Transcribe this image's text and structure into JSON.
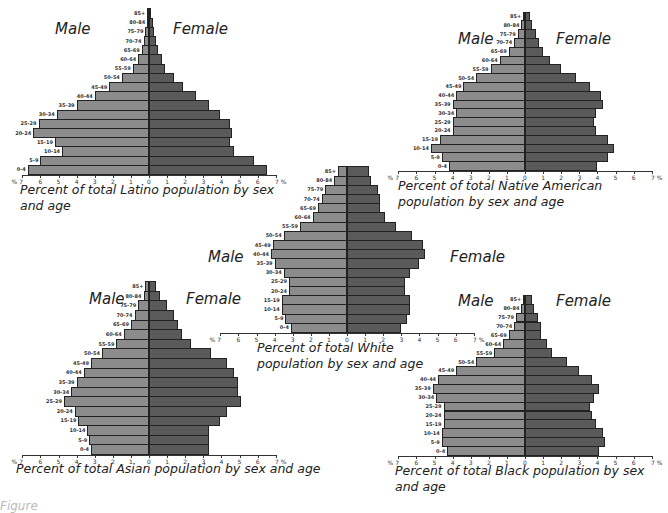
{
  "age_groups": [
    "0-4",
    "5-9",
    "10-14",
    "15-19",
    "20-24",
    "25-29",
    "30-34",
    "35-39",
    "40-44",
    "45-49",
    "50-54",
    "55-59",
    "60-64",
    "65-69",
    "70-74",
    "75-79",
    "80-84",
    "85+"
  ],
  "labels": {
    "male": "Male",
    "female": "Female",
    "axis_unit": "%"
  },
  "colors": {
    "male": "#8c8c8c",
    "female": "#5a5a5a",
    "outline": "#222222"
  },
  "chart_data": [
    {
      "type": "bar",
      "subtype": "population-pyramid",
      "title": "Percent of total Latino population by sex and age",
      "categories": [
        "0-4",
        "5-9",
        "10-14",
        "15-19",
        "20-24",
        "25-29",
        "30-34",
        "35-39",
        "40-44",
        "45-49",
        "50-54",
        "55-59",
        "60-64",
        "65-69",
        "70-74",
        "75-79",
        "80-84",
        "85+"
      ],
      "series": [
        {
          "name": "Male",
          "values": [
            6.7,
            6.0,
            4.8,
            5.2,
            6.4,
            6.1,
            5.1,
            4.0,
            3.0,
            2.2,
            1.5,
            0.9,
            0.6,
            0.4,
            0.3,
            0.2,
            0.1,
            0.1
          ]
        },
        {
          "name": "Female",
          "values": [
            6.5,
            5.8,
            4.7,
            4.5,
            4.6,
            4.5,
            3.9,
            3.3,
            2.6,
            1.9,
            1.4,
            0.9,
            0.7,
            0.5,
            0.4,
            0.3,
            0.2,
            0.1
          ]
        }
      ],
      "xlabel": "%",
      "xticks": [
        7,
        6,
        5,
        4,
        3,
        2,
        1,
        0,
        1,
        2,
        3,
        4,
        5,
        6,
        7
      ],
      "xlim": [
        -7,
        7
      ]
    },
    {
      "type": "bar",
      "subtype": "population-pyramid",
      "title": "Percent of total Native American population by sex and age",
      "categories": [
        "0-4",
        "5-9",
        "10-14",
        "15-19",
        "20-24",
        "25-29",
        "30-34",
        "35-39",
        "40-44",
        "45-49",
        "50-54",
        "55-59",
        "60-64",
        "65-69",
        "70-74",
        "75-79",
        "80-84",
        "85+"
      ],
      "series": [
        {
          "name": "Male",
          "values": [
            4.2,
            4.6,
            5.2,
            4.7,
            4.0,
            4.0,
            3.8,
            4.0,
            3.8,
            3.4,
            2.7,
            1.9,
            1.4,
            0.9,
            0.6,
            0.4,
            0.2,
            0.1
          ]
        },
        {
          "name": "Female",
          "values": [
            4.0,
            4.6,
            4.9,
            4.6,
            3.9,
            3.8,
            3.9,
            4.3,
            4.2,
            3.6,
            2.8,
            2.0,
            1.4,
            1.0,
            0.8,
            0.6,
            0.4,
            0.3
          ]
        }
      ],
      "xlabel": "%",
      "xticks": [
        7,
        6,
        5,
        4,
        3,
        2,
        1,
        0,
        1,
        2,
        3,
        4,
        5,
        6,
        7
      ],
      "xlim": [
        -7,
        7
      ]
    },
    {
      "type": "bar",
      "subtype": "population-pyramid",
      "title": "Percent of total White population by sex and age",
      "categories": [
        "0-4",
        "5-9",
        "10-14",
        "15-19",
        "20-24",
        "25-29",
        "30-34",
        "35-39",
        "40-44",
        "45-49",
        "50-54",
        "55-59",
        "60-64",
        "65-69",
        "70-74",
        "75-79",
        "80-84",
        "85+"
      ],
      "series": [
        {
          "name": "Male",
          "values": [
            3.1,
            3.4,
            3.6,
            3.6,
            3.2,
            3.2,
            3.5,
            4.0,
            4.2,
            4.1,
            3.5,
            2.6,
            1.9,
            1.6,
            1.4,
            1.2,
            0.7,
            0.5
          ]
        },
        {
          "name": "Female",
          "values": [
            3.0,
            3.3,
            3.5,
            3.5,
            3.2,
            3.2,
            3.5,
            4.0,
            4.3,
            4.2,
            3.6,
            2.7,
            2.1,
            1.8,
            1.8,
            1.7,
            1.3,
            1.2
          ]
        }
      ],
      "xlabel": "%",
      "xticks": [
        7,
        6,
        5,
        4,
        3,
        2,
        1,
        0,
        1,
        2,
        3,
        4,
        5,
        6,
        7
      ],
      "xlim": [
        -7,
        7
      ]
    },
    {
      "type": "bar",
      "subtype": "population-pyramid",
      "title": "Percent of total Asian population by sex and age",
      "categories": [
        "0-4",
        "5-9",
        "10-14",
        "15-19",
        "20-24",
        "25-29",
        "30-34",
        "35-39",
        "40-44",
        "45-49",
        "50-54",
        "55-59",
        "60-64",
        "65-69",
        "70-74",
        "75-79",
        "80-84",
        "85+"
      ],
      "series": [
        {
          "name": "Male",
          "values": [
            3.2,
            3.3,
            3.4,
            3.9,
            4.1,
            4.7,
            4.3,
            4.0,
            3.6,
            3.2,
            2.6,
            1.8,
            1.4,
            1.0,
            0.8,
            0.6,
            0.3,
            0.2
          ]
        },
        {
          "name": "Female",
          "values": [
            3.3,
            3.3,
            3.3,
            3.9,
            4.3,
            5.1,
            4.9,
            4.9,
            4.7,
            4.3,
            3.4,
            2.3,
            1.8,
            1.6,
            1.4,
            1.0,
            0.6,
            0.4
          ]
        }
      ],
      "xlabel": "%",
      "xticks": [
        7,
        6,
        5,
        4,
        3,
        2,
        1,
        0,
        1,
        2,
        3,
        4,
        5,
        6,
        7
      ],
      "xlim": [
        -7,
        7
      ]
    },
    {
      "type": "bar",
      "subtype": "population-pyramid",
      "title": "Percent of total Black population by sex and age",
      "categories": [
        "0-4",
        "5-9",
        "10-14",
        "15-19",
        "20-24",
        "25-29",
        "30-34",
        "35-39",
        "40-44",
        "45-49",
        "50-54",
        "55-59",
        "60-64",
        "65-69",
        "70-74",
        "75-79",
        "80-84",
        "85+"
      ],
      "series": [
        {
          "name": "Male",
          "values": [
            4.3,
            4.6,
            4.6,
            4.5,
            4.5,
            4.5,
            4.9,
            5.1,
            4.8,
            3.8,
            2.7,
            1.7,
            1.2,
            0.9,
            0.6,
            0.5,
            0.2,
            0.1
          ]
        },
        {
          "name": "Female",
          "values": [
            4.1,
            4.4,
            4.3,
            3.9,
            3.7,
            3.6,
            3.8,
            4.1,
            3.7,
            3.0,
            2.3,
            1.5,
            1.2,
            0.9,
            0.9,
            0.7,
            0.5,
            0.4
          ]
        }
      ],
      "xlabel": "%",
      "xticks": [
        7,
        6,
        5,
        4,
        3,
        2,
        1,
        0,
        1,
        2,
        3,
        4,
        5,
        6,
        7
      ],
      "xlim": [
        -7,
        7
      ]
    }
  ],
  "pyramids": [
    {
      "id": "latino",
      "title": "Percent of total Latino population by sex and age",
      "cx": 149,
      "axis_y": 174,
      "px_per_pct": 18.1,
      "bar_h": 9.2,
      "male_label": {
        "x": 55,
        "y": 20
      },
      "female_label": {
        "x": 173,
        "y": 20
      },
      "title_pos": {
        "x": 20,
        "y": 182,
        "w": 270
      }
    },
    {
      "id": "native-american",
      "title": "Percent of total Native American population by sex and age",
      "cx": 525,
      "axis_y": 170,
      "px_per_pct": 18.1,
      "bar_h": 8.8,
      "male_label": {
        "x": 458,
        "y": 30
      },
      "female_label": {
        "x": 556,
        "y": 30
      },
      "title_pos": {
        "x": 398,
        "y": 178,
        "w": 270
      }
    },
    {
      "id": "white",
      "title": "Percent of total White population by sex and age",
      "cx": 347,
      "axis_y": 332,
      "px_per_pct": 18.1,
      "bar_h": 9.2,
      "male_label": {
        "x": 208,
        "y": 248
      },
      "female_label": {
        "x": 450,
        "y": 248
      },
      "title_pos": {
        "x": 257,
        "y": 340,
        "w": 200
      }
    },
    {
      "id": "asian",
      "title": "Percent of total Asian population by sex and age",
      "cx": 149,
      "axis_y": 454,
      "px_per_pct": 18.1,
      "bar_h": 9.6,
      "male_label": {
        "x": 89,
        "y": 290
      },
      "female_label": {
        "x": 186,
        "y": 290
      },
      "title_pos": {
        "x": 16,
        "y": 461,
        "w": 340
      }
    },
    {
      "id": "black",
      "title": "Percent of total Black population by sex and age",
      "cx": 525,
      "axis_y": 455,
      "px_per_pct": 18.1,
      "bar_h": 8.9,
      "male_label": {
        "x": 458,
        "y": 292
      },
      "female_label": {
        "x": 556,
        "y": 292
      },
      "title_pos": {
        "x": 395,
        "y": 463,
        "w": 275
      }
    }
  ],
  "footer_text_partial": "Figure"
}
